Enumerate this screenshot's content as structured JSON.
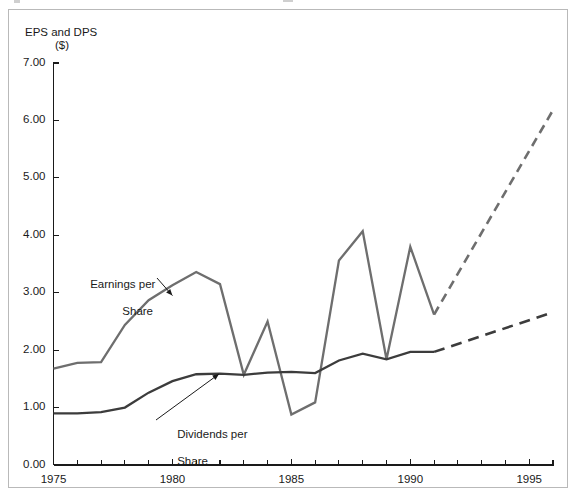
{
  "figure": {
    "y_axis_title_line1": "EPS and DPS",
    "y_axis_title_line2": "($)",
    "eps_annotation_line1": "Earnings per",
    "eps_annotation_line2": "Share",
    "dps_annotation_line1": "Dividends per",
    "dps_annotation_line2": "Share",
    "colors": {
      "eps_line": "#6e6e6e",
      "dps_line": "#3c3c3c",
      "axis": "#1a1a1a",
      "frame": "#b9b9b9",
      "background": "#ffffff"
    }
  },
  "chart_data": {
    "type": "line",
    "title": "",
    "subtitle": "",
    "xlabel": "",
    "ylabel": "EPS and DPS ($)",
    "xlim": [
      1975,
      1996
    ],
    "ylim": [
      0.0,
      7.0
    ],
    "grid": false,
    "legend_position": "inline-annotations",
    "y_ticks": [
      0.0,
      1.0,
      2.0,
      3.0,
      4.0,
      5.0,
      6.0,
      7.0
    ],
    "y_tick_labels": [
      "0.00",
      "1.00",
      "2.00",
      "3.00",
      "4.00",
      "5.00",
      "6.00",
      "7.00"
    ],
    "x_ticks": [
      1975,
      1976,
      1977,
      1978,
      1979,
      1980,
      1981,
      1982,
      1983,
      1984,
      1985,
      1986,
      1987,
      1988,
      1989,
      1990,
      1991,
      1992,
      1993,
      1994,
      1995,
      1996
    ],
    "x_tick_labels_shown": [
      "1975",
      "1980",
      "1985",
      "1990",
      "1995"
    ],
    "x_labeled_ticks": [
      1975,
      1980,
      1985,
      1990,
      1995
    ],
    "series": [
      {
        "name": "Earnings per Share",
        "color": "#6e6e6e",
        "style": "solid",
        "x": [
          1975,
          1976,
          1977,
          1978,
          1979,
          1980,
          1981,
          1982,
          1983,
          1984,
          1985,
          1986,
          1987,
          1988,
          1989,
          1990,
          1991
        ],
        "values": [
          1.68,
          1.78,
          1.79,
          2.44,
          2.87,
          3.13,
          3.36,
          3.15,
          1.57,
          2.5,
          0.88,
          1.09,
          3.56,
          4.07,
          1.84,
          3.8,
          2.62
        ]
      },
      {
        "name": "Earnings per Share (projected)",
        "color": "#6e6e6e",
        "style": "dashed",
        "x": [
          1991,
          1996
        ],
        "values": [
          2.62,
          6.18
        ]
      },
      {
        "name": "Dividends per Share",
        "color": "#3c3c3c",
        "style": "solid",
        "x": [
          1975,
          1976,
          1977,
          1978,
          1979,
          1980,
          1981,
          1982,
          1983,
          1984,
          1985,
          1986,
          1987,
          1988,
          1989,
          1990,
          1991
        ],
        "values": [
          0.9,
          0.9,
          0.92,
          1.0,
          1.26,
          1.46,
          1.58,
          1.59,
          1.57,
          1.61,
          1.62,
          1.6,
          1.82,
          1.94,
          1.84,
          1.97,
          1.97
        ]
      },
      {
        "name": "Dividends per Share (projected)",
        "color": "#3c3c3c",
        "style": "dashed",
        "x": [
          1991,
          1996
        ],
        "values": [
          1.97,
          2.66
        ]
      }
    ],
    "annotations": [
      {
        "text": "Earnings per Share",
        "target_x": 1980,
        "target_y": 2.95
      },
      {
        "text": "Dividends per Share",
        "target_x": 1982,
        "target_y": 1.62
      }
    ]
  }
}
